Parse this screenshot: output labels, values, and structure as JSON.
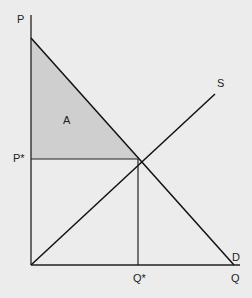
{
  "diagram": {
    "type": "supply-demand",
    "axes": {
      "y_label": "P",
      "x_label": "Q"
    },
    "curves": {
      "supply_label": "S",
      "demand_label": "D"
    },
    "equilibrium": {
      "price_label": "P*",
      "quantity_label": "Q*"
    },
    "regions": {
      "area_label": "A"
    },
    "colors": {
      "line": "#111111",
      "shade": "#cfcfcf",
      "background": "#ececec"
    }
  }
}
